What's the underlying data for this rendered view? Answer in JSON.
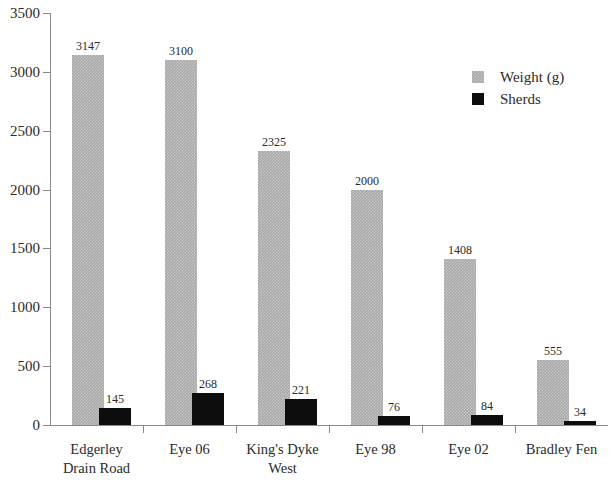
{
  "chart_data": {
    "type": "bar",
    "title": "",
    "subtitle": "",
    "xlabel": "",
    "ylabel": "",
    "ylim": [
      0,
      3500
    ],
    "ytick_values": [
      0,
      500,
      1000,
      1500,
      2000,
      2500,
      3000,
      3500
    ],
    "ytick_labels": [
      "0",
      "500",
      "1000",
      "1500",
      "2000",
      "2500",
      "3000",
      "3500"
    ],
    "grid": false,
    "legend_position": "top-right",
    "categories": [
      "Edgerley\nDrain Road",
      "Eye 06",
      "King's Dyke\nWest",
      "Eye 98",
      "Eye 02",
      "Bradley Fen"
    ],
    "category_lines": [
      [
        "Edgerley",
        "Drain Road"
      ],
      [
        "Eye 06",
        ""
      ],
      [
        "King's Dyke",
        "West"
      ],
      [
        "Eye 98",
        ""
      ],
      [
        "Eye 02",
        ""
      ],
      [
        "Bradley Fen",
        ""
      ]
    ],
    "series": [
      {
        "name": "Weight (g)",
        "color": "#a9a9a9",
        "values": [
          3147,
          3100,
          2325,
          2000,
          1408,
          555
        ],
        "labels": [
          "3147",
          "3100",
          "2325",
          "2000",
          "1408",
          "555"
        ]
      },
      {
        "name": "Sherds",
        "color": "#0d0d0d",
        "values": [
          145,
          268,
          221,
          76,
          84,
          34
        ],
        "labels": [
          "145",
          "268",
          "221",
          "76",
          "84",
          "34"
        ]
      }
    ]
  },
  "legend": {
    "items": [
      {
        "label": "Weight (g)",
        "swatch": "weight"
      },
      {
        "label": "Sherds",
        "swatch": "sherds"
      }
    ]
  }
}
